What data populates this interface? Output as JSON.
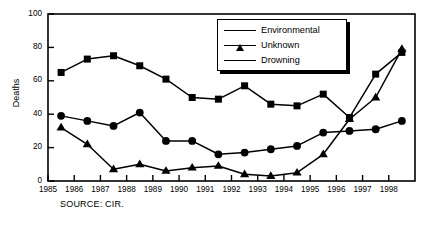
{
  "chart_data": {
    "type": "line",
    "title": "",
    "xlabel": "",
    "ylabel": "Deaths",
    "ylim": [
      0,
      100
    ],
    "yticks": [
      0,
      20,
      40,
      60,
      80,
      100
    ],
    "xlim": [
      1985,
      1999
    ],
    "xticks": [
      1985,
      1986,
      1987,
      1988,
      1989,
      1990,
      1991,
      1992,
      1993,
      1994,
      1995,
      1996,
      1997,
      1998
    ],
    "xtick_labels": [
      "1985",
      "1986",
      "1987",
      "1988",
      "1989",
      "1990",
      "1991",
      "1992",
      "1993",
      "1994",
      "1995",
      "1996",
      "1997",
      "1998"
    ],
    "categories": [
      "1985",
      "1986",
      "1987",
      "1988",
      "1989",
      "1990",
      "1991",
      "1992",
      "1993",
      "1994",
      "1995",
      "1996",
      "1997",
      "1998"
    ],
    "x": [
      1985.5,
      1986.5,
      1987.5,
      1988.5,
      1989.5,
      1990.5,
      1991.5,
      1992.5,
      1993.5,
      1994.5,
      1995.5,
      1996.5,
      1997.5,
      1998.5
    ],
    "grid": false,
    "legend_position": "top-right",
    "series": [
      {
        "name": "Environmental",
        "marker": "triangle",
        "values": [
          32,
          22,
          7,
          10,
          6,
          8,
          9,
          4,
          3,
          5,
          16,
          37,
          50,
          79
        ]
      },
      {
        "name": "Unknown",
        "marker": "circle",
        "values": [
          39,
          36,
          33,
          41,
          24,
          24,
          16,
          17,
          19,
          21,
          29,
          30,
          31,
          36
        ]
      },
      {
        "name": "Drowning",
        "marker": "square",
        "values": [
          65,
          73,
          75,
          69,
          61,
          50,
          49,
          57,
          46,
          45,
          52,
          38,
          64,
          77
        ]
      }
    ],
    "annotations": [
      "SOURCE: CIR."
    ],
    "colors": {
      "line": "#000000",
      "marker": "#000000",
      "background": "#ffffff",
      "axis": "#000000"
    }
  },
  "source_note": "SOURCE: CIR.",
  "axis": {
    "y_title": "Deaths"
  }
}
